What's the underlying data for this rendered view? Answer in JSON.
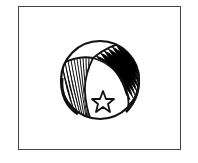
{
  "illustration": {
    "subject": "beach ball with star",
    "frame": {
      "stroke": "#444444",
      "fill": "#ffffff"
    },
    "ball": {
      "stroke": "#111111",
      "fill": "#ffffff",
      "hatch": "#111111"
    },
    "star": {
      "stroke": "#111111",
      "fill": "#ffffff"
    }
  }
}
